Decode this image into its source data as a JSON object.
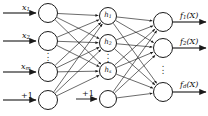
{
  "diagram": {
    "type": "neural-network",
    "colors": {
      "background": "#ffffff",
      "stroke": "#1a1a1a",
      "node_fill": "#ffffff",
      "text": "#111111"
    },
    "layers": [
      {
        "name": "input",
        "nodes": [
          {
            "id": "in1",
            "label": "",
            "cx": 48,
            "cy": 13,
            "r": 9.5
          },
          {
            "id": "in2",
            "label": "",
            "cx": 48,
            "cy": 41,
            "r": 9.5
          },
          {
            "id": "in3",
            "label": "",
            "cx": 48,
            "cy": 72,
            "r": 9.5
          },
          {
            "id": "in4",
            "label": "",
            "cx": 48,
            "cy": 100,
            "r": 9.5
          }
        ],
        "ellipsis": {
          "cx": 48,
          "cy": 56
        }
      },
      {
        "name": "hidden",
        "nodes": [
          {
            "id": "h1",
            "label": "h",
            "sub": "1",
            "cx": 108,
            "cy": 16,
            "r": 8.5
          },
          {
            "id": "h2",
            "label": "h",
            "sub": "2",
            "cx": 108,
            "cy": 43,
            "r": 8.5
          },
          {
            "id": "hs",
            "label": "h",
            "sub": "s",
            "cx": 108,
            "cy": 71,
            "r": 8.5
          },
          {
            "id": "hbias",
            "label": "",
            "sub": "",
            "cx": 108,
            "cy": 99,
            "r": 8.5
          }
        ],
        "ellipsis": {
          "cx": 108,
          "cy": 57
        }
      },
      {
        "name": "output",
        "nodes": [
          {
            "id": "o1",
            "label": "",
            "cx": 163,
            "cy": 22,
            "r": 9.5
          },
          {
            "id": "o2",
            "label": "",
            "cx": 163,
            "cy": 48,
            "r": 9.5
          },
          {
            "id": "od",
            "label": "",
            "cx": 163,
            "cy": 92,
            "r": 9.5
          }
        ],
        "ellipsis": {
          "cx": 163,
          "cy": 69
        }
      }
    ],
    "input_labels": [
      {
        "base": "x",
        "sub": "1",
        "x": 22,
        "y": 4
      },
      {
        "base": "x",
        "sub": "2",
        "x": 22,
        "y": 32
      },
      {
        "base": "x",
        "sub": "m",
        "x": 21,
        "y": 63
      },
      {
        "base": "+1",
        "sub": "",
        "x": 21,
        "y": 92
      }
    ],
    "bias_label": {
      "base": "+1",
      "sub": "",
      "x": 82,
      "y": 90
    },
    "output_labels": [
      {
        "base": "f",
        "sub": "1",
        "arg": "(X)",
        "x": 180,
        "y": 12
      },
      {
        "base": "f",
        "sub": "2",
        "arg": "(X)",
        "x": 180,
        "y": 38
      },
      {
        "base": "f",
        "sub": "d",
        "arg": "(X)",
        "x": 180,
        "y": 81
      }
    ],
    "input_arrows": [
      {
        "x1": 3,
        "y1": 13,
        "x2": 36,
        "y2": 13
      },
      {
        "x1": 3,
        "y1": 41,
        "x2": 36,
        "y2": 41
      },
      {
        "x1": 3,
        "y1": 72,
        "x2": 36,
        "y2": 72
      },
      {
        "x1": 3,
        "y1": 100,
        "x2": 36,
        "y2": 100
      }
    ],
    "bias_arrow": {
      "x1": 76,
      "y1": 99,
      "x2": 97,
      "y2": 99
    },
    "output_arrows": [
      {
        "x1": 173,
        "y1": 22,
        "x2": 206,
        "y2": 22
      },
      {
        "x1": 173,
        "y1": 48,
        "x2": 206,
        "y2": 48
      },
      {
        "x1": 173,
        "y1": 92,
        "x2": 206,
        "y2": 92
      }
    ],
    "edges_note": "fully connected: every input node to every hidden node (h1,h2,hs); every hidden node to every output node"
  }
}
